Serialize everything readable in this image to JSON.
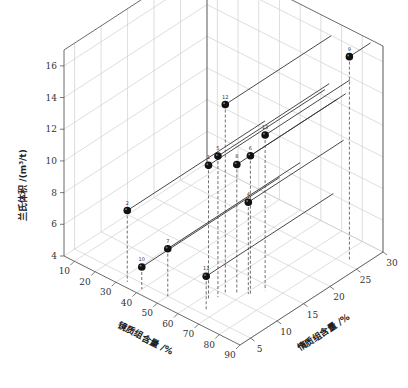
{
  "chart_data": {
    "type": "scatter3d",
    "title": "",
    "xlabel": "镜质组含量 /%",
    "ylabel": "惰质组含量 /%",
    "zlabel": "兰氏体积 /(m³/t)",
    "x_ticks": [
      "10",
      "20",
      "30",
      "40",
      "50",
      "60",
      "70",
      "80",
      "90"
    ],
    "y_ticks": [
      "5",
      "10",
      "15",
      "20",
      "25",
      "30"
    ],
    "z_ticks": [
      "4",
      "6",
      "8",
      "10",
      "12",
      "14",
      "16"
    ],
    "xlim": [
      5,
      90
    ],
    "ylim": [
      3,
      30
    ],
    "zlim": [
      4,
      17
    ],
    "grid": true,
    "legend": "none",
    "points": [
      {
        "label": "1",
        "x": 62,
        "y": 8,
        "z": 12.4
      },
      {
        "label": "2",
        "x": 33,
        "y": 4,
        "z": 8.5
      },
      {
        "label": "4",
        "x": 71,
        "y": 12,
        "z": 9.8
      },
      {
        "label": "5",
        "x": 64,
        "y": 9,
        "z": 12.9
      },
      {
        "label": "6",
        "x": 72,
        "y": 12,
        "z": 12.8
      },
      {
        "label": "7",
        "x": 50,
        "y": 5,
        "z": 7.0
      },
      {
        "label": "8",
        "x": 68,
        "y": 11,
        "z": 12.2
      },
      {
        "label": "9",
        "x": 84,
        "y": 26,
        "z": 16.8
      },
      {
        "label": "10",
        "x": 40,
        "y": 4,
        "z": 5.4
      },
      {
        "label": "11",
        "x": 66,
        "y": 6,
        "z": 6.1
      },
      {
        "label": "12",
        "x": 65,
        "y": 10,
        "z": 16.0
      },
      {
        "label": "13",
        "x": 74,
        "y": 14,
        "z": 13.8
      }
    ]
  },
  "labels": {
    "xlabel": "镜质组含量 /%",
    "ylabel": "惰质组含量 /%",
    "zlabel": "兰氏体积 /(m³/t)"
  }
}
